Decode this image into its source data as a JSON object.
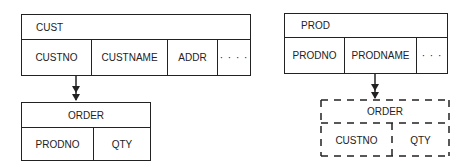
{
  "diagram": {
    "left": {
      "parent": {
        "title": "CUST",
        "fields": [
          "CUSTNO",
          "CUSTNAME",
          "ADDR",
          "· · · ·"
        ]
      },
      "child": {
        "title": "ORDER",
        "fields": [
          "PRODNO",
          "QTY"
        ],
        "style": "solid"
      },
      "relationship": "one-to-many"
    },
    "right": {
      "parent": {
        "title": "PROD",
        "fields": [
          "PRODNO",
          "PRODNAME",
          "· · ·"
        ]
      },
      "child": {
        "title": "ORDER",
        "fields": [
          "CUSTNO",
          "QTY"
        ],
        "style": "dashed"
      },
      "relationship": "one-to-many"
    }
  },
  "colors": {
    "line": "#222222",
    "background": "#ffffff"
  }
}
